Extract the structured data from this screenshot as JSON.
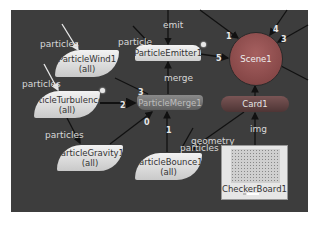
{
  "graph": {
    "nodes": {
      "particle_wind": {
        "name": "ParticleWind1",
        "sub": "(all)"
      },
      "particle_turbulence": {
        "name": "ParticleTurbulence1",
        "sub": "(all)"
      },
      "particle_emitter": {
        "name": "ParticleEmitter1"
      },
      "particle_merge": {
        "name": "ParticleMerge1"
      },
      "particle_gravity": {
        "name": "ParticleGravity1",
        "sub": "(all)"
      },
      "particle_bounce": {
        "name": "ParticleBounce1",
        "sub": "(all)"
      },
      "scene": {
        "name": "Scene1"
      },
      "card": {
        "name": "Card1"
      },
      "checkerboard": {
        "name": "CheckerBoard1"
      }
    },
    "input_labels": {
      "wind_particles": "particles",
      "turbulence_particles": "particles",
      "emitter_particle": "particle",
      "emitter_emit": "emit",
      "emitter_merge": "merge",
      "gravity_particles": "particles",
      "bounce_geometry": "geometry",
      "bounce_particles": "particles",
      "card_img": "img"
    },
    "port_numbers": {
      "scene_1": "1",
      "scene_4": "4",
      "scene_3": "3",
      "scene_5": "5",
      "merge_3": "3",
      "merge_2": "2",
      "merge_0": "0",
      "merge_1": "1"
    },
    "colors": {
      "canvas_bg": "#3d3d3d",
      "scene_node": "#8f4f4f",
      "card_node": "#634444",
      "merge_node": "#747474",
      "op_node": "#e0e0e0"
    }
  }
}
